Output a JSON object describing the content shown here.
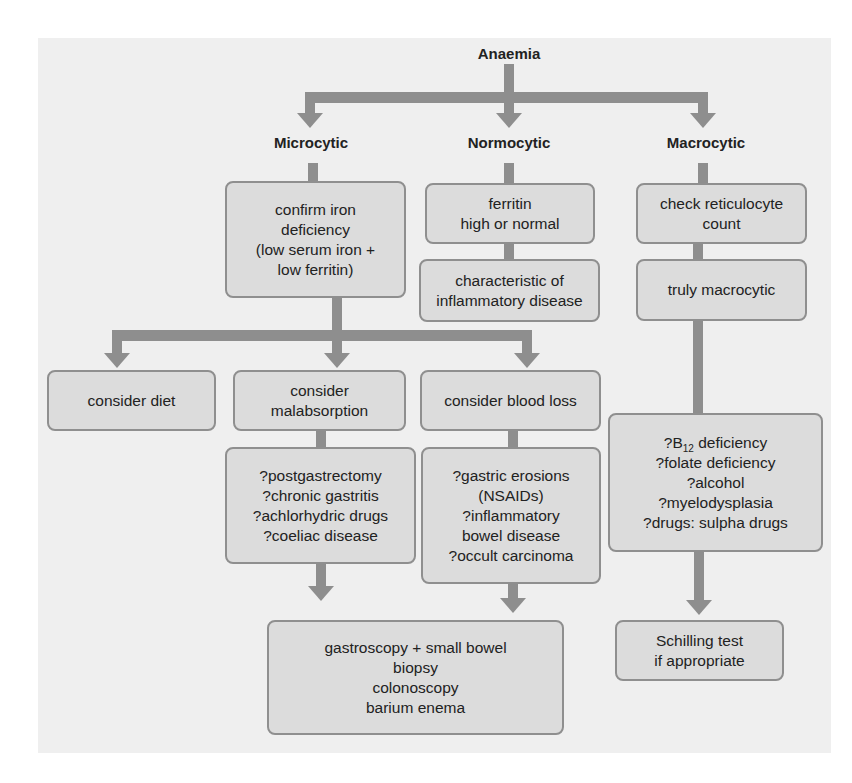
{
  "diagram": {
    "root": "Anaemia",
    "branches": {
      "microcytic": {
        "label": "Microcytic",
        "confirm": [
          "confirm iron",
          "deficiency",
          "(low serum iron +",
          "low ferritin)"
        ],
        "options": {
          "diet": [
            "consider diet"
          ],
          "malabsorption": [
            "consider",
            "malabsorption"
          ],
          "blood_loss": [
            "consider blood loss"
          ]
        },
        "malabsorption_causes": [
          "?postgastrectomy",
          "?chronic gastritis",
          "?achlorhydric drugs",
          "?coeliac disease"
        ],
        "blood_loss_causes": [
          "?gastric erosions",
          "(NSAIDs)",
          "?inflammatory",
          "bowel disease",
          "?occult carcinoma"
        ],
        "investigations": [
          "gastroscopy + small bowel",
          "biopsy",
          "colonoscopy",
          "barium enema"
        ]
      },
      "normocytic": {
        "label": "Normocytic",
        "ferritin": [
          "ferritin",
          "high or normal"
        ],
        "interpretation": [
          "characteristic of",
          "inflammatory disease"
        ]
      },
      "macrocytic": {
        "label": "Macrocytic",
        "check": [
          "check reticulocyte",
          "count"
        ],
        "confirm": [
          "truly macrocytic"
        ],
        "causes": {
          "b12_prefix": "?B",
          "b12_sub": "12",
          "b12_suffix": " deficiency",
          "others": [
            "?folate deficiency",
            "?alcohol",
            "?myelodysplasia",
            "?drugs: sulpha drugs"
          ]
        },
        "test": [
          "Schilling test",
          "if appropriate"
        ]
      }
    },
    "colors": {
      "connector": "#8e8e8e",
      "box_fill": "#dcdcdc",
      "box_border": "#8f8f8f",
      "panel": "#efefef"
    }
  }
}
